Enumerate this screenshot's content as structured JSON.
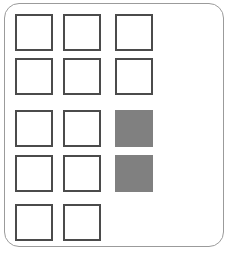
{
  "panel": {
    "name": "rounded-panel",
    "border_color": "#9b9b9b",
    "background_color": "#ffffff",
    "corner_radius_px": 15,
    "x": 4,
    "y": 3,
    "width": 220,
    "height": 244
  },
  "grid": {
    "cell_width_px": 38,
    "cell_height_px": 37,
    "cell_border_color": "#4b4b4b",
    "cell_empty_fill": "#ffffff",
    "cell_selected_fill": "#808080",
    "column_x": [
      15,
      63,
      115
    ],
    "row_y": [
      14,
      58,
      110,
      155,
      204
    ],
    "rows": [
      {
        "index": 0,
        "label": "row-1",
        "cells": [
          {
            "label": "cell-r1c1",
            "column": 0,
            "state": "empty"
          },
          {
            "label": "cell-r1c2",
            "column": 1,
            "state": "empty"
          },
          {
            "label": "cell-r1c3",
            "column": 2,
            "state": "empty"
          }
        ]
      },
      {
        "index": 1,
        "label": "row-2",
        "cells": [
          {
            "label": "cell-r2c1",
            "column": 0,
            "state": "empty"
          },
          {
            "label": "cell-r2c2",
            "column": 1,
            "state": "empty"
          },
          {
            "label": "cell-r2c3",
            "column": 2,
            "state": "empty"
          }
        ]
      },
      {
        "index": 2,
        "label": "row-3",
        "cells": [
          {
            "label": "cell-r3c1",
            "column": 0,
            "state": "empty"
          },
          {
            "label": "cell-r3c2",
            "column": 1,
            "state": "empty"
          },
          {
            "label": "cell-r3c3",
            "column": 2,
            "state": "selected"
          }
        ]
      },
      {
        "index": 3,
        "label": "row-4",
        "cells": [
          {
            "label": "cell-r4c1",
            "column": 0,
            "state": "empty"
          },
          {
            "label": "cell-r4c2",
            "column": 1,
            "state": "empty"
          },
          {
            "label": "cell-r4c3",
            "column": 2,
            "state": "selected"
          }
        ]
      },
      {
        "index": 4,
        "label": "row-5",
        "cells": [
          {
            "label": "cell-r5c1",
            "column": 0,
            "state": "empty"
          },
          {
            "label": "cell-r5c2",
            "column": 1,
            "state": "empty"
          }
        ]
      }
    ]
  }
}
